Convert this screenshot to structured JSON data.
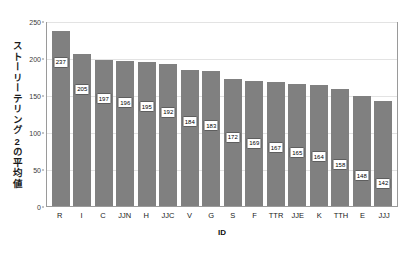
{
  "chart_data": {
    "type": "bar",
    "title": "",
    "xlabel": "ID",
    "ylabel": "ストーリーテリング2の平均値",
    "categories": [
      "R",
      "I",
      "C",
      "JJN",
      "H",
      "JJC",
      "V",
      "G",
      "S",
      "F",
      "TTR",
      "JJE",
      "K",
      "TTH",
      "E",
      "JJJ"
    ],
    "values": [
      237,
      205,
      197,
      196,
      195,
      192,
      184,
      183,
      172,
      169,
      167,
      165,
      164,
      158,
      148,
      142
    ],
    "value_labels": [
      "237",
      "205",
      "197",
      "196",
      "195",
      "192",
      "184",
      "183",
      "172",
      "169",
      "167",
      "165",
      "164",
      "158",
      "148",
      "142"
    ],
    "ylim": [
      0,
      250
    ],
    "yticks": [
      0,
      50,
      100,
      150,
      200,
      250
    ],
    "ytick_labels": [
      "0",
      "50",
      "100",
      "150",
      "200",
      "250"
    ],
    "grid": true,
    "legend": "none",
    "bar_color": "#808080",
    "grid_color": "#e3e3e3",
    "axis_color": "#9a9a9a",
    "label_box_border": "#5e5e5e",
    "label_box_background": "#ffffff"
  }
}
